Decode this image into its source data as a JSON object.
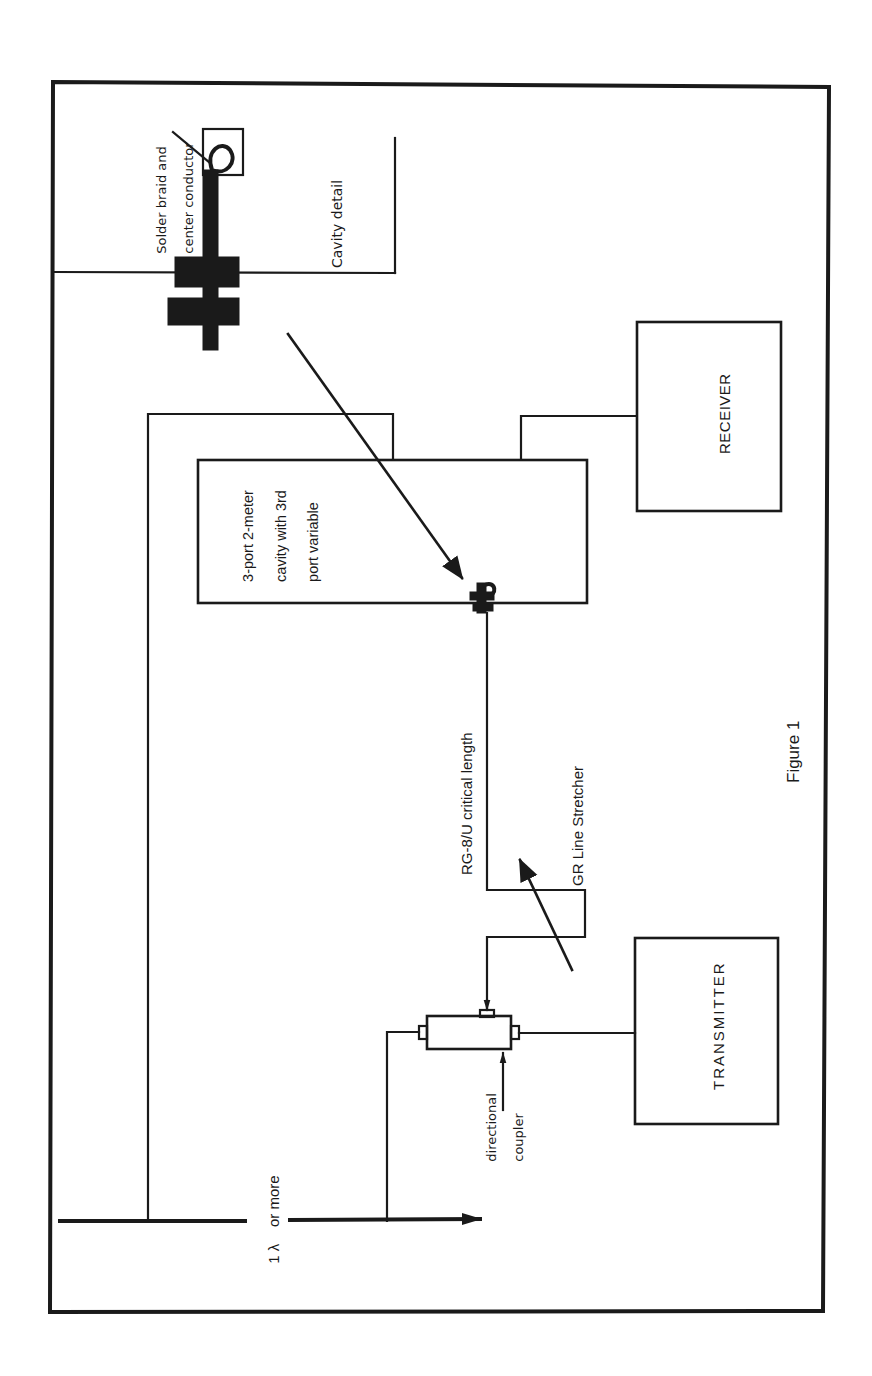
{
  "figure": {
    "caption": "Figure 1",
    "orientation": "rotated 90° counter-clockwise (text reads bottom-to-top)",
    "colors": {
      "ink": "#1a1a1a",
      "paper": "#ffffff"
    }
  },
  "blocks": {
    "receiver": {
      "label": "RECEIVER"
    },
    "transmitter": {
      "label": "TRANSMITTER"
    },
    "cavity": {
      "label_line1": "3-port 2-meter",
      "label_line2": "cavity with 3rd",
      "label_line3": "port variable"
    },
    "cavity_detail": {
      "title": "Cavity detail",
      "note_line1": "Solder braid and",
      "note_line2": "center conductor"
    }
  },
  "annotations": {
    "coax": "RG-8/U critical length",
    "line_stretcher": "GR Line Stretcher",
    "coupler_line1": "directional",
    "coupler_line2": "coupler",
    "antenna_spacing_a": "1 λ",
    "antenna_spacing_b": "or more"
  }
}
